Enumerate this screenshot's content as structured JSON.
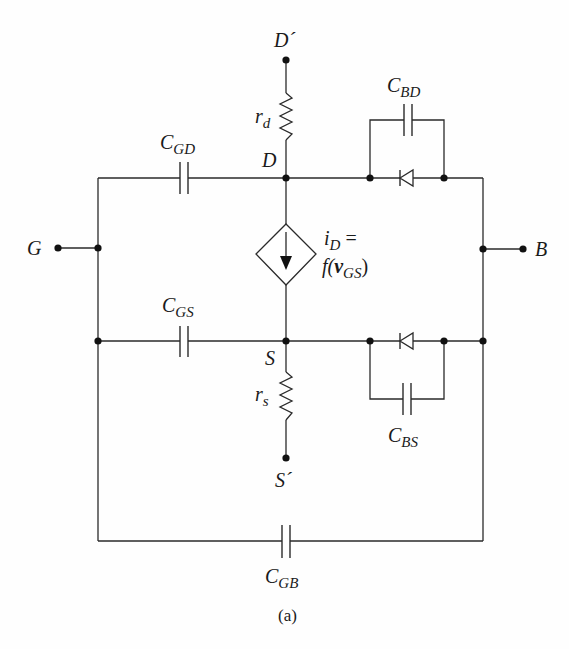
{
  "figure": {
    "caption": "(a)"
  },
  "terminals": {
    "drain_ext": "D´",
    "drain": "D",
    "source": "S",
    "source_ext": "S´",
    "gate": "G",
    "bulk": "B"
  },
  "components": {
    "rd": {
      "main": "r",
      "sub": "d"
    },
    "rs": {
      "main": "r",
      "sub": "s"
    },
    "cgd": {
      "main": "C",
      "sub": "GD"
    },
    "cgs": {
      "main": "C",
      "sub": "GS"
    },
    "cbd": {
      "main": "C",
      "sub": "BD"
    },
    "cbs": {
      "main": "C",
      "sub": "BS"
    },
    "cgb": {
      "main": "C",
      "sub": "GB"
    },
    "source_line1_main": "i",
    "source_line1_sub": "D",
    "source_line1_eq": " =",
    "source_line2_pre": "f(",
    "source_line2_v": "v",
    "source_line2_sub": "GS",
    "source_line2_post": ")"
  },
  "colors": {
    "ink": "#2a2a2a",
    "background": "#fefefe"
  }
}
